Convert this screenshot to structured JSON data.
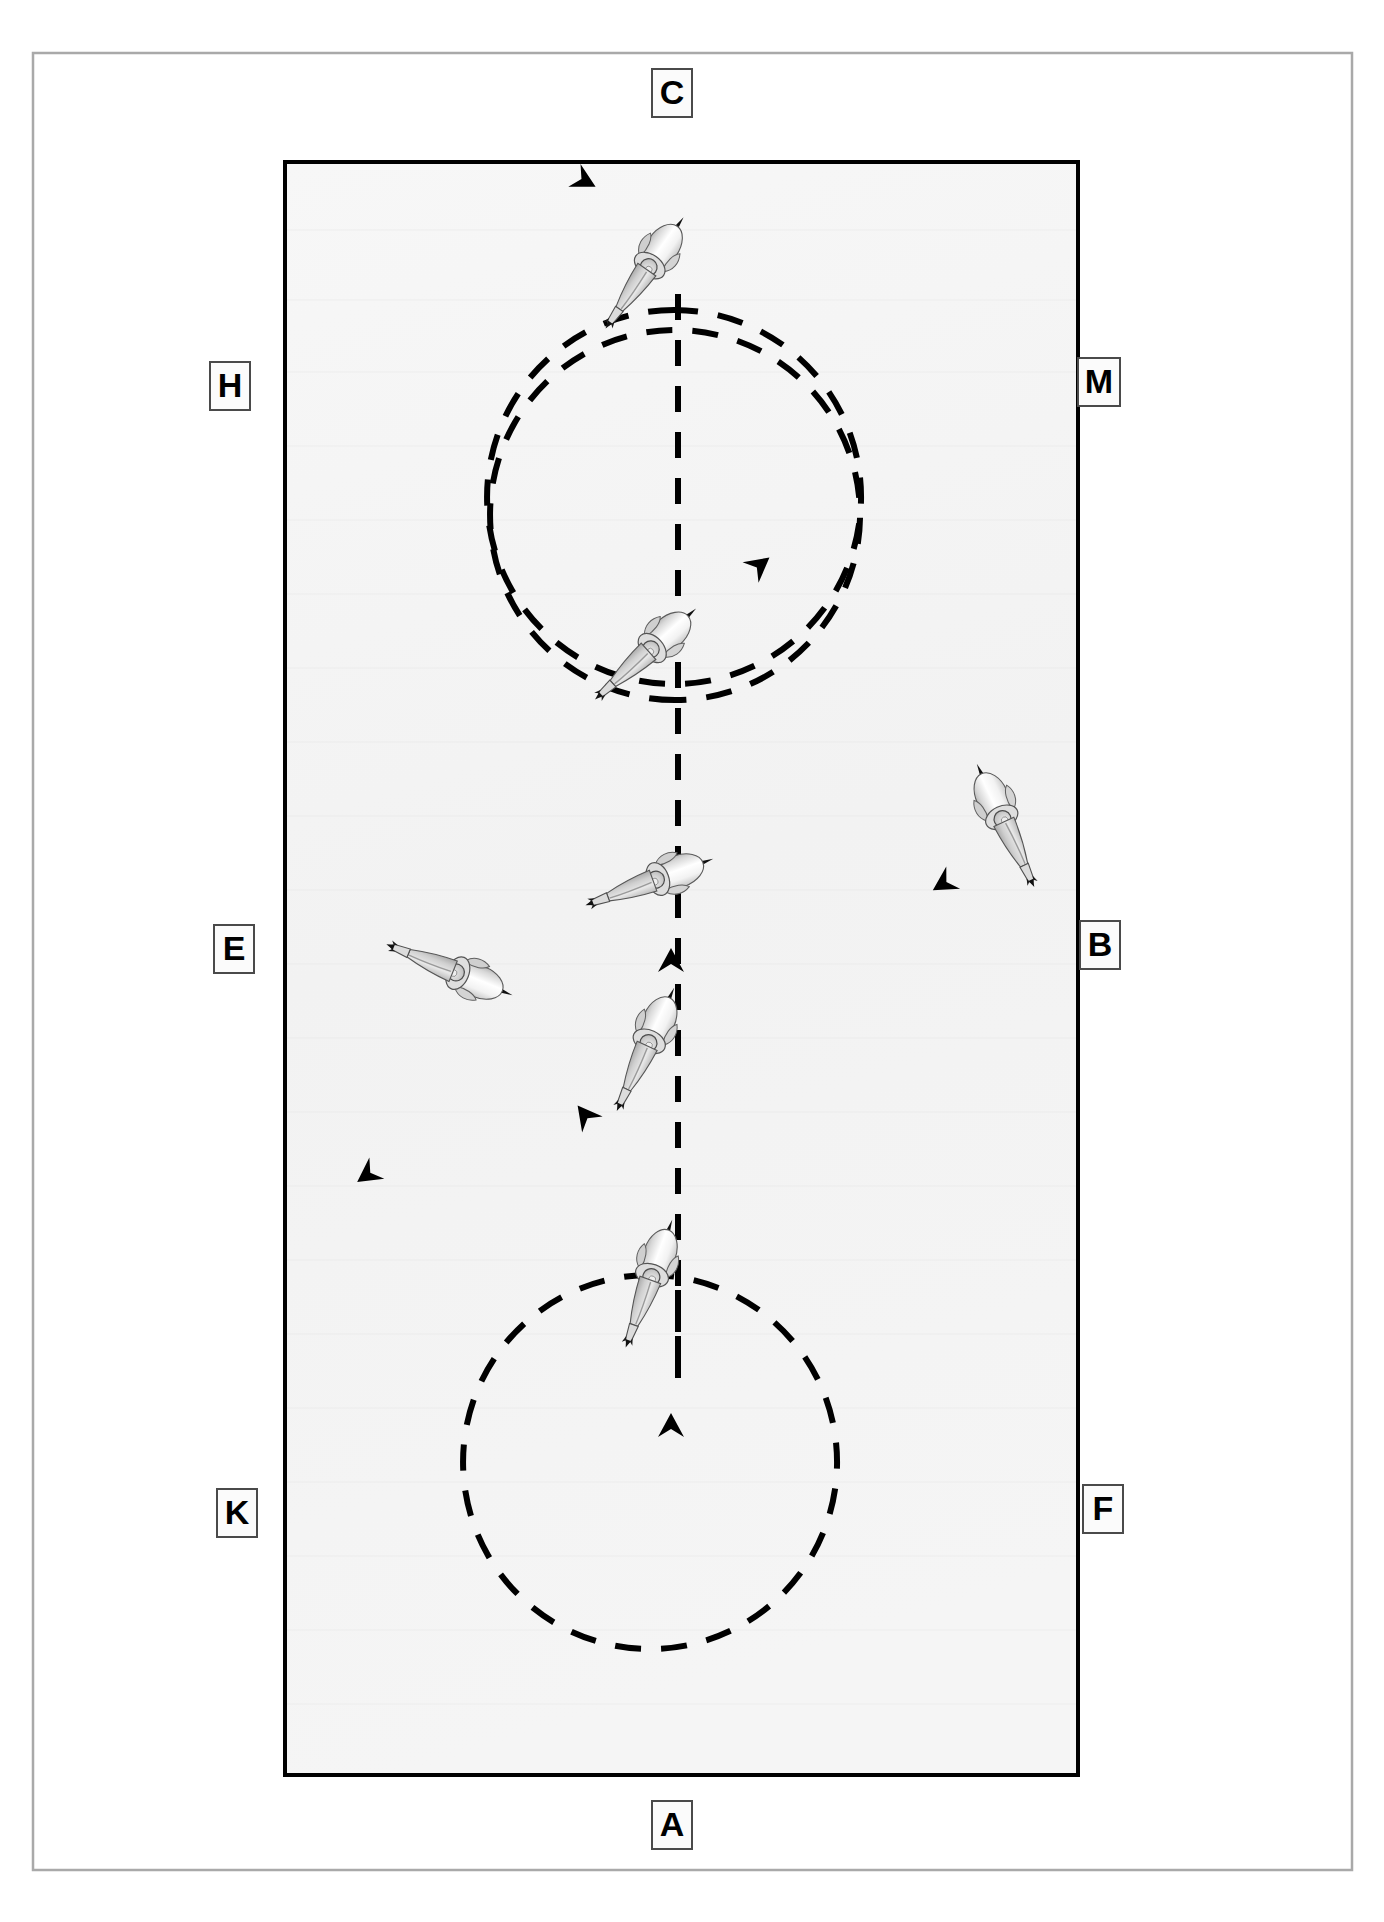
{
  "diagram": {
    "discipline": "dressage",
    "arena": {
      "type": "standard-dressage-arena",
      "fill_color": "#f4f4f4",
      "border_color": "#000000",
      "outer_frame_color": "#a9a9a9",
      "x": 285,
      "y": 162,
      "width": 793,
      "height": 1613
    },
    "centerline": {
      "name": "centre-line",
      "style": "dashed",
      "color": "#000000",
      "x": 678,
      "y_start": 1378,
      "y_end": 278
    },
    "letters": [
      {
        "id": "C",
        "label": "C",
        "x": 651,
        "y": 68,
        "w": 42,
        "h": 50,
        "position": "top-center-outside"
      },
      {
        "id": "H",
        "label": "H",
        "x": 209,
        "y": 361,
        "w": 42,
        "h": 50,
        "position": "left-upper-outside"
      },
      {
        "id": "M",
        "label": "M",
        "x": 1077,
        "y": 357,
        "w": 44,
        "h": 50,
        "position": "right-upper-outside"
      },
      {
        "id": "E",
        "label": "E",
        "x": 213,
        "y": 924,
        "w": 42,
        "h": 50,
        "position": "left-middle-outside"
      },
      {
        "id": "B",
        "label": "B",
        "x": 1079,
        "y": 920,
        "w": 42,
        "h": 50,
        "position": "right-middle-outside"
      },
      {
        "id": "K",
        "label": "K",
        "x": 216,
        "y": 1488,
        "w": 42,
        "h": 50,
        "position": "left-lower-outside"
      },
      {
        "id": "F",
        "label": "F",
        "x": 1082,
        "y": 1484,
        "w": 42,
        "h": 50,
        "position": "right-lower-outside"
      },
      {
        "id": "A",
        "label": "A",
        "x": 651,
        "y": 1800,
        "w": 42,
        "h": 50,
        "position": "bottom-center-outside"
      }
    ],
    "circles": [
      {
        "id": "circle-top-left",
        "name": "20m circle at C",
        "cx": 487,
        "cy": 310,
        "r": 187,
        "direction": "counter-clockwise",
        "style": "dashed",
        "color": "#000000"
      },
      {
        "id": "circle-right",
        "name": "20m circle at B",
        "cx": 860,
        "cy": 700,
        "r": 185,
        "direction": "clockwise",
        "style": "dashed",
        "color": "#000000"
      },
      {
        "id": "circle-bottom-left",
        "name": "20m circle at E/K",
        "cx": 463,
        "cy": 1275,
        "r": 187,
        "direction": "counter-clockwise",
        "style": "dashed",
        "color": "#000000"
      }
    ],
    "riders": [
      {
        "id": "rider-1",
        "x": 678,
        "y": 232,
        "rotation": 215,
        "scale": 1.0,
        "note": "top circle, heading left on circle"
      },
      {
        "id": "rider-2",
        "x": 678,
        "y": 612,
        "rotation": 225,
        "scale": 1.0,
        "note": "entering right circle"
      },
      {
        "id": "rider-3",
        "x": 678,
        "y": 843,
        "rotation": 250,
        "scale": 1.0,
        "note": "closing right circle at centre line"
      },
      {
        "id": "rider-4",
        "x": 1020,
        "y": 785,
        "rotation": 160,
        "scale": 1.0,
        "note": "far side of right circle"
      },
      {
        "id": "rider-5",
        "x": 678,
        "y": 1005,
        "rotation": 205,
        "scale": 1.0,
        "note": "entering bottom-left circle"
      },
      {
        "id": "rider-6",
        "x": 448,
        "y": 938,
        "rotation": 290,
        "scale": 1.0,
        "note": "top of bottom-left circle"
      },
      {
        "id": "rider-7",
        "x": 678,
        "y": 1238,
        "rotation": 200,
        "scale": 1.0,
        "note": "bottom of centre line"
      }
    ],
    "arrows": [
      {
        "id": "arrow-top-circle",
        "x": 583,
        "y": 181,
        "rotation": 118
      },
      {
        "id": "arrow-right-circle-entry",
        "x": 758,
        "y": 565,
        "rotation": 52
      },
      {
        "id": "arrow-right-circle-far",
        "x": 943,
        "y": 884,
        "rotation": 238
      },
      {
        "id": "arrow-centerline-mid",
        "x": 671,
        "y": 960,
        "rotation": 0
      },
      {
        "id": "arrow-bottom-circle",
        "x": 583,
        "y": 1115,
        "rotation": 322
      },
      {
        "id": "arrow-bottom-left",
        "x": 367,
        "y": 1175,
        "rotation": 235
      },
      {
        "id": "arrow-centerline-bottom",
        "x": 671,
        "y": 1425,
        "rotation": 0
      }
    ]
  }
}
